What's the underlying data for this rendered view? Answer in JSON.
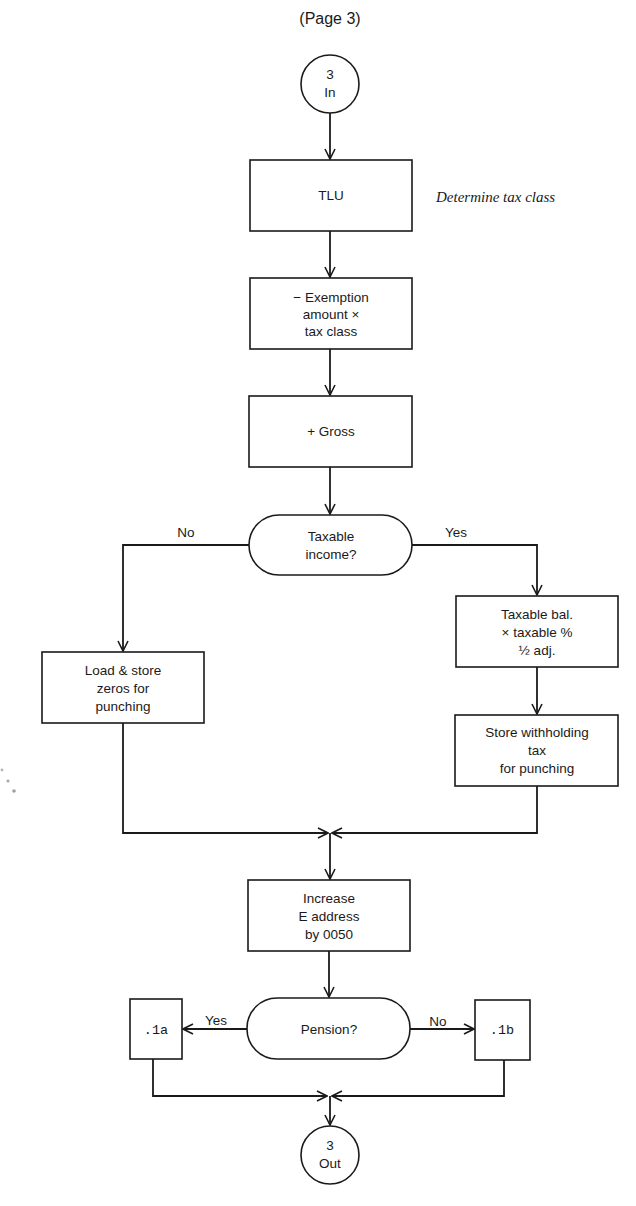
{
  "page": {
    "title": "(Page 3)"
  },
  "flowchart": {
    "start_connector": {
      "line1": "3",
      "line2": "In"
    },
    "nodes": {
      "tlu": {
        "lines": [
          "TLU"
        ]
      },
      "tlu_note": "Determine tax class",
      "exemption": {
        "lines": [
          "− Exemption",
          "amount ×",
          "tax class"
        ]
      },
      "gross": {
        "lines": [
          "+ Gross"
        ]
      },
      "taxable_decision": {
        "lines": [
          "Taxable",
          "income?"
        ]
      },
      "load_zeros": {
        "lines": [
          "Load & store",
          "zeros for",
          "punching"
        ]
      },
      "taxable_balance": {
        "lines": [
          "Taxable bal.",
          "× taxable %",
          "½ adj."
        ]
      },
      "store_withholding": {
        "lines": [
          "Store withholding",
          "tax",
          "for punching"
        ]
      },
      "increase_address": {
        "lines": [
          "Increase",
          "E address",
          "by 0050"
        ]
      },
      "pension_decision": {
        "lines": [
          "Pension?"
        ]
      },
      "branch_1a": {
        "lines": [
          ".1a"
        ]
      },
      "branch_1b": {
        "lines": [
          ".1b"
        ]
      }
    },
    "labels": {
      "taxable_no": "No",
      "taxable_yes": "Yes",
      "pension_yes": "Yes",
      "pension_no": "No"
    },
    "end_connector": {
      "line1": "3",
      "line2": "Out"
    }
  }
}
